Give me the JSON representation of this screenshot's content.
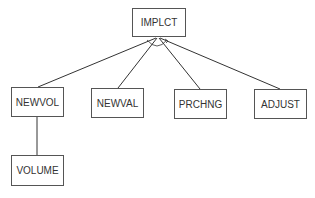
{
  "diagram": {
    "type": "tree",
    "root": {
      "id": "implct",
      "label": "IMPLCT"
    },
    "nodes": [
      {
        "id": "implct",
        "label": "IMPLCT",
        "x": 132,
        "y": 8,
        "w": 54,
        "h": 29
      },
      {
        "id": "newvol",
        "label": "NEWVOL",
        "x": 11,
        "y": 87,
        "w": 53,
        "h": 30
      },
      {
        "id": "newval",
        "label": "NEWVAL",
        "x": 91,
        "y": 88,
        "w": 53,
        "h": 30
      },
      {
        "id": "prchng",
        "label": "PRCHNG",
        "x": 174,
        "y": 89,
        "w": 53,
        "h": 30
      },
      {
        "id": "adjust",
        "label": "ADJUST",
        "x": 254,
        "y": 89,
        "w": 53,
        "h": 30
      },
      {
        "id": "volume",
        "label": "VOLUME",
        "x": 11,
        "y": 155,
        "w": 53,
        "h": 31
      }
    ],
    "edges": [
      {
        "from": "newvol",
        "to": "implct",
        "and_arc": true
      },
      {
        "from": "newval",
        "to": "implct",
        "and_arc": true
      },
      {
        "from": "prchng",
        "to": "implct",
        "and_arc": true
      },
      {
        "from": "adjust",
        "to": "implct",
        "and_arc": true
      },
      {
        "from": "volume",
        "to": "newvol",
        "and_arc": false
      }
    ],
    "and_arc": {
      "around": "implct",
      "arrow": true
    }
  }
}
